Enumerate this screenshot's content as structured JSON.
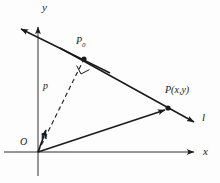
{
  "figure": {
    "background_color": "#fdfdfd",
    "stroke_color": "#1a1a1a",
    "axes": {
      "x_label": "x",
      "y_label": "y",
      "origin_label": "O"
    },
    "labels": {
      "point_foot": "P",
      "point_foot_subscript": "0",
      "point_general": "P(x,y)",
      "line_name": "l",
      "distance": "p",
      "normal_vector": "n"
    },
    "geometry": {
      "origin": [
        38,
        152
      ],
      "x_axis_start": [
        4,
        152
      ],
      "x_axis_end": [
        197,
        152
      ],
      "y_axis_top": [
        38,
        24
      ],
      "y_axis_bottom": [
        38,
        176
      ],
      "line_l_start": [
        18,
        29
      ],
      "line_l_end": [
        197,
        124
      ],
      "point_p0": [
        84,
        59
      ],
      "point_p": [
        168,
        108
      ],
      "normal_arrow_end": [
        47,
        126
      ],
      "right_angle_marker": [
        82,
        63
      ]
    }
  }
}
